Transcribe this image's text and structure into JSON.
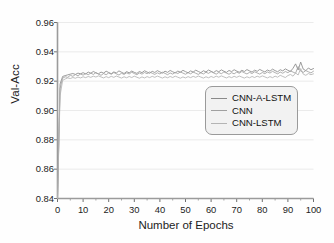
{
  "chart_data": {
    "type": "line",
    "title": "",
    "xlabel": "Number of Epochs",
    "ylabel": "Val-Acc",
    "xlim": [
      0,
      100
    ],
    "ylim": [
      0.84,
      0.96
    ],
    "xticks": [
      0,
      10,
      20,
      30,
      40,
      50,
      60,
      70,
      80,
      90,
      100
    ],
    "xtick_labels": [
      "0",
      "10",
      "20",
      "30",
      "40",
      "50",
      "60",
      "70",
      "80",
      "90",
      "100"
    ],
    "yticks": [
      0.84,
      0.86,
      0.88,
      0.9,
      0.92,
      0.94,
      0.96
    ],
    "ytick_labels": [
      "0.84",
      "0.86",
      "0.88",
      "0.90",
      "0.92",
      "0.94",
      "0.96"
    ],
    "grid": true,
    "grid_axis": "y",
    "legend_position": "center-right",
    "x": [
      0,
      1,
      2,
      3,
      4,
      5,
      6,
      7,
      8,
      9,
      10,
      11,
      12,
      13,
      14,
      15,
      16,
      17,
      18,
      19,
      20,
      21,
      22,
      23,
      24,
      25,
      26,
      27,
      28,
      29,
      30,
      31,
      32,
      33,
      34,
      35,
      36,
      37,
      38,
      39,
      40,
      41,
      42,
      43,
      44,
      45,
      46,
      47,
      48,
      49,
      50,
      51,
      52,
      53,
      54,
      55,
      56,
      57,
      58,
      59,
      60,
      61,
      62,
      63,
      64,
      65,
      66,
      67,
      68,
      69,
      70,
      71,
      72,
      73,
      74,
      75,
      76,
      77,
      78,
      79,
      80,
      81,
      82,
      83,
      84,
      85,
      86,
      87,
      88,
      89,
      90,
      91,
      92,
      93,
      94,
      95,
      96,
      97,
      98,
      99,
      100
    ],
    "series": [
      {
        "name": "CNN-A-LSTM",
        "color": "#8a8a8a",
        "values": [
          0.84,
          0.918,
          0.9232,
          0.9238,
          0.9243,
          0.9248,
          0.9252,
          0.9246,
          0.9255,
          0.925,
          0.9258,
          0.9249,
          0.9262,
          0.9254,
          0.9266,
          0.9257,
          0.925,
          0.9262,
          0.9255,
          0.9268,
          0.9259,
          0.9251,
          0.9263,
          0.9256,
          0.927,
          0.9261,
          0.9252,
          0.9265,
          0.9257,
          0.9269,
          0.926,
          0.9253,
          0.9266,
          0.9258,
          0.9271,
          0.9262,
          0.9254,
          0.9267,
          0.9259,
          0.9272,
          0.9263,
          0.9255,
          0.9268,
          0.926,
          0.9273,
          0.9264,
          0.9256,
          0.9269,
          0.9261,
          0.9274,
          0.9265,
          0.9257,
          0.927,
          0.9262,
          0.9275,
          0.9266,
          0.9258,
          0.9271,
          0.9263,
          0.9276,
          0.9267,
          0.9259,
          0.9272,
          0.9264,
          0.9277,
          0.9268,
          0.926,
          0.9273,
          0.9265,
          0.9278,
          0.9269,
          0.9261,
          0.9274,
          0.9266,
          0.9279,
          0.927,
          0.9262,
          0.9275,
          0.9267,
          0.928,
          0.9271,
          0.9263,
          0.9276,
          0.9268,
          0.9282,
          0.9272,
          0.9264,
          0.9278,
          0.927,
          0.9284,
          0.9274,
          0.9266,
          0.9288,
          0.9318,
          0.9276,
          0.933,
          0.9282,
          0.9272,
          0.929,
          0.9278,
          0.9286
        ]
      },
      {
        "name": "CNN",
        "color": "#a0a0a0",
        "values": [
          0.84,
          0.915,
          0.922,
          0.923,
          0.9226,
          0.924,
          0.9233,
          0.9245,
          0.9237,
          0.9249,
          0.9241,
          0.9252,
          0.9244,
          0.9255,
          0.9246,
          0.9258,
          0.9248,
          0.924,
          0.9252,
          0.9244,
          0.9256,
          0.9247,
          0.9259,
          0.925,
          0.9242,
          0.9254,
          0.9246,
          0.9257,
          0.9249,
          0.9261,
          0.9252,
          0.9244,
          0.9256,
          0.9248,
          0.9259,
          0.9251,
          0.9263,
          0.9254,
          0.9246,
          0.9257,
          0.9249,
          0.9261,
          0.9253,
          0.9244,
          0.9256,
          0.9248,
          0.926,
          0.9252,
          0.9263,
          0.9255,
          0.9247,
          0.9258,
          0.925,
          0.9262,
          0.9254,
          0.9246,
          0.9257,
          0.9249,
          0.9261,
          0.9253,
          0.9265,
          0.9256,
          0.9248,
          0.9259,
          0.9251,
          0.9263,
          0.9255,
          0.9247,
          0.9258,
          0.925,
          0.9262,
          0.9254,
          0.9266,
          0.9257,
          0.9249,
          0.926,
          0.9252,
          0.9264,
          0.9256,
          0.9248,
          0.9259,
          0.9251,
          0.9263,
          0.9255,
          0.9267,
          0.9258,
          0.925,
          0.9262,
          0.9254,
          0.9266,
          0.9258,
          0.927,
          0.9262,
          0.9254,
          0.93,
          0.9268,
          0.926,
          0.9272,
          0.9264,
          0.9256,
          0.9268
        ]
      },
      {
        "name": "CNN-LSTM",
        "color": "#b4b4b4",
        "values": [
          0.84,
          0.91,
          0.9205,
          0.9215,
          0.9222,
          0.9218,
          0.9225,
          0.922,
          0.9228,
          0.9222,
          0.923,
          0.9224,
          0.9232,
          0.9226,
          0.9234,
          0.9228,
          0.9236,
          0.9229,
          0.9222,
          0.9231,
          0.9224,
          0.9233,
          0.9226,
          0.9235,
          0.9228,
          0.9221,
          0.923,
          0.9223,
          0.9232,
          0.9225,
          0.9234,
          0.9227,
          0.922,
          0.9229,
          0.9222,
          0.9231,
          0.9224,
          0.9233,
          0.9226,
          0.9235,
          0.9228,
          0.9221,
          0.923,
          0.9223,
          0.9232,
          0.9225,
          0.9234,
          0.9227,
          0.922,
          0.9229,
          0.9222,
          0.9231,
          0.9224,
          0.9233,
          0.9226,
          0.9235,
          0.9228,
          0.9221,
          0.923,
          0.9223,
          0.9232,
          0.9225,
          0.9234,
          0.9227,
          0.9236,
          0.9229,
          0.9222,
          0.9231,
          0.9224,
          0.9233,
          0.9226,
          0.9235,
          0.9228,
          0.9221,
          0.923,
          0.9223,
          0.9232,
          0.9225,
          0.9234,
          0.9227,
          0.9236,
          0.9229,
          0.9222,
          0.9231,
          0.9224,
          0.9234,
          0.9227,
          0.924,
          0.9232,
          0.9225,
          0.9238,
          0.9246,
          0.9234,
          0.9256,
          0.9242,
          0.9286,
          0.9248,
          0.924,
          0.9252,
          0.9244,
          0.925
        ]
      }
    ]
  },
  "legend": {
    "items": [
      {
        "label": "CNN-A-LSTM"
      },
      {
        "label": "CNN"
      },
      {
        "label": "CNN-LSTM"
      }
    ]
  }
}
